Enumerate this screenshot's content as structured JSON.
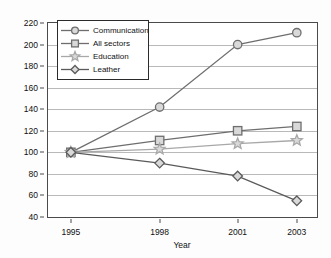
{
  "chart_data": {
    "type": "line",
    "title": "",
    "xlabel": "Year",
    "ylabel": "Index",
    "categories": [
      "1995",
      "1998",
      "2001",
      "2003"
    ],
    "x": [
      1995,
      1998,
      2001,
      2003
    ],
    "ylim": [
      40,
      220
    ],
    "yticks": [
      40,
      60,
      80,
      100,
      120,
      140,
      160,
      180,
      200,
      220
    ],
    "grid": "horizontal",
    "legend_position": "top-left",
    "series": [
      {
        "name": "Communication",
        "marker": "circle",
        "color": "#6e6e6e",
        "values": [
          100,
          142,
          200,
          211
        ]
      },
      {
        "name": "All sectors",
        "marker": "square",
        "color": "#6e6e6e",
        "values": [
          100,
          111,
          120,
          124
        ]
      },
      {
        "name": "Education",
        "marker": "star",
        "color": "#a8a8a8",
        "values": [
          100,
          103,
          108,
          111
        ]
      },
      {
        "name": "Leather",
        "marker": "diamond",
        "color": "#5a5a5a",
        "values": [
          100,
          90,
          78,
          55
        ]
      }
    ]
  },
  "legend": {
    "items": [
      {
        "label": "Communication",
        "marker": "circle-marker"
      },
      {
        "label": "All sectors",
        "marker": "square-marker"
      },
      {
        "label": "Education",
        "marker": "star-marker"
      },
      {
        "label": "Leather",
        "marker": "diamond-marker"
      }
    ]
  },
  "axes": {
    "y_title": "Index",
    "x_title": "Year",
    "y_tick_labels": [
      "220",
      "200",
      "180",
      "160",
      "140",
      "120",
      "100",
      "80",
      "60",
      "40"
    ],
    "x_tick_labels": [
      "1995",
      "1998",
      "2001",
      "2003"
    ]
  }
}
